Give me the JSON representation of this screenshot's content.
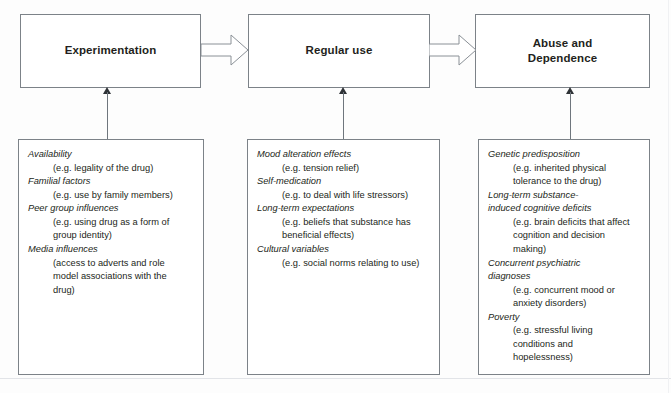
{
  "diagram": {
    "colors": {
      "box_border": "#7c8288",
      "text": "#231f20",
      "arrow_line": "#6f767d",
      "arrow_head": "#2f3337",
      "background": "#fdfdfd"
    },
    "stages": [
      {
        "id": "experimentation",
        "label": "Experimentation"
      },
      {
        "id": "regular-use",
        "label": "Regular use"
      },
      {
        "id": "abuse-and-dependence",
        "label": "Abuse and\nDependence"
      }
    ],
    "flow_arrows": [
      {
        "id": "arrow-experimentation-to-regular-use",
        "from": "experimentation",
        "to": "regular-use",
        "shape": "block-arrow-right"
      },
      {
        "id": "arrow-regular-use-to-abuse",
        "from": "regular-use",
        "to": "abuse-and-dependence",
        "shape": "block-arrow-right"
      }
    ],
    "contributing_arrows": [
      {
        "id": "arrow-factors-to-experimentation",
        "from": "experimentation-factors",
        "to": "experimentation",
        "shape": "line-arrow-up"
      },
      {
        "id": "arrow-factors-to-regular-use",
        "from": "regular-use-factors",
        "to": "regular-use",
        "shape": "line-arrow-up"
      },
      {
        "id": "arrow-factors-to-abuse",
        "from": "abuse-factors",
        "to": "abuse-and-dependence",
        "shape": "line-arrow-up"
      }
    ],
    "factor_groups": [
      {
        "id": "experimentation-factors",
        "stage": "experimentation",
        "items": [
          {
            "heading": "Availability",
            "example": "(e.g. legality of the drug)"
          },
          {
            "heading": "Familial factors",
            "example": "(e.g. use by family members)"
          },
          {
            "heading": "Peer group influences",
            "example": "(e.g. using drug as a form of\ngroup identity)"
          },
          {
            "heading": "Media influences",
            "example": "(access to adverts and role\nmodel associations with the\ndrug)"
          }
        ]
      },
      {
        "id": "regular-use-factors",
        "stage": "regular-use",
        "items": [
          {
            "heading": "Mood alteration effects",
            "example": "(e.g. tension relief)"
          },
          {
            "heading": "Self-medication",
            "example": "(e.g. to deal with life stressors)"
          },
          {
            "heading": "Long-term expectations",
            "example": "(e.g. beliefs that substance has\nbeneficial effects)"
          },
          {
            "heading": "Cultural variables",
            "example": "(e.g. social norms relating to use)"
          }
        ]
      },
      {
        "id": "abuse-factors",
        "stage": "abuse-and-dependence",
        "items": [
          {
            "heading": "Genetic predisposition",
            "example": "(e.g. inherited physical\ntolerance to the drug)"
          },
          {
            "heading": "Long-term substance-\ninduced cognitive deficits",
            "example": "(e.g. brain deficits that affect\ncognition and decision\nmaking)"
          },
          {
            "heading": "Concurrent psychiatric\ndiagnoses",
            "example": "(e.g. concurrent mood or\nanxiety disorders)"
          },
          {
            "heading": "Poverty",
            "example": "(e.g. stressful living\nconditions and\nhopelessness)"
          }
        ]
      }
    ]
  }
}
